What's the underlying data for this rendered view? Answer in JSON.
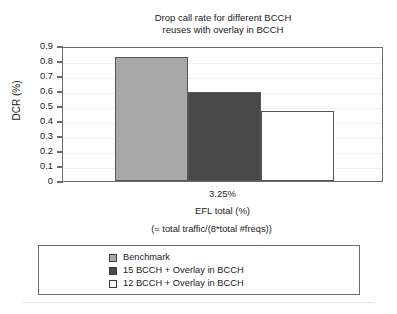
{
  "chart_data": {
    "type": "bar",
    "title": "Drop call rate for different BCCH\nreuses with overlay in BCCH",
    "xlabel": "EFL total (%)",
    "xlabel_note": "(= total traffic/(8*total #freqs))",
    "ylabel": "DCR (%)",
    "categories": [
      "3.25%"
    ],
    "ylim": [
      0,
      0.9
    ],
    "yticks": [
      "0",
      "0.1",
      "0.2",
      "0.3",
      "0.4",
      "0.5",
      "0.6",
      "0.7",
      "0.8",
      "0.9"
    ],
    "ytick_values": [
      0,
      0.1,
      0.2,
      0.3,
      0.4,
      0.5,
      0.6,
      0.7,
      0.8,
      0.9
    ],
    "grid": true,
    "legend_position": "bottom",
    "series": [
      {
        "name": "Benchmark",
        "values": [
          0.825
        ],
        "color": "#a8a8a8"
      },
      {
        "name": "15 BCCH + Overlay in BCCH",
        "values": [
          0.595
        ],
        "color": "#484848"
      },
      {
        "name": "12 BCCH + Overlay in BCCH",
        "values": [
          0.47
        ],
        "color": "#ffffff"
      }
    ]
  },
  "chart": {
    "title_line1": "Drop call rate for different BCCH",
    "title_line2": "reuses with overlay in BCCH",
    "y_axis_title": "DCR (%)",
    "x_category": "3.25%",
    "x_axis_title": "EFL total (%)",
    "x_axis_subtitle": "(= total traffic/(8*total #freqs))"
  },
  "y_ticks": [
    {
      "label": "0.9",
      "value": 0.9
    },
    {
      "label": "0.8",
      "value": 0.8
    },
    {
      "label": "0.7",
      "value": 0.7
    },
    {
      "label": "0.6",
      "value": 0.6
    },
    {
      "label": "0.5",
      "value": 0.5
    },
    {
      "label": "0.4",
      "value": 0.4
    },
    {
      "label": "0.3",
      "value": 0.3
    },
    {
      "label": "0.2",
      "value": 0.2
    },
    {
      "label": "0.1",
      "value": 0.1
    },
    {
      "label": "0",
      "value": 0
    }
  ],
  "bars": [
    {
      "name": "Benchmark",
      "value": 0.825,
      "color": "#a8a8a8"
    },
    {
      "name": "15 BCCH + Overlay in BCCH",
      "value": 0.595,
      "color": "#484848"
    },
    {
      "name": "12 BCCH + Overlay in BCCH",
      "value": 0.47,
      "color": "#ffffff"
    }
  ],
  "legend": {
    "items": [
      {
        "label": "Benchmark",
        "color": "#a8a8a8"
      },
      {
        "label": "15 BCCH + Overlay in BCCH",
        "color": "#484848"
      },
      {
        "label": "12 BCCH + Overlay in BCCH",
        "color": "#ffffff"
      }
    ]
  }
}
